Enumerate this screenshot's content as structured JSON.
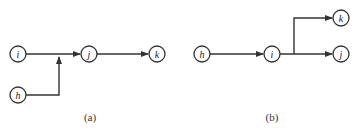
{
  "diagrams": [
    {
      "id": "a",
      "caption": "(a)",
      "nodes": [
        {
          "label": "i",
          "x": 18,
          "y": 54
        },
        {
          "label": "j",
          "x": 89,
          "y": 54
        },
        {
          "label": "k",
          "x": 157,
          "y": 54
        },
        {
          "label": "h",
          "x": 18,
          "y": 95
        }
      ],
      "edges": [
        {
          "from": "i",
          "to": "j"
        },
        {
          "from": "j",
          "to": "k"
        },
        {
          "from": "h",
          "to": "i-j edge (merge)"
        }
      ]
    },
    {
      "id": "b",
      "caption": "(b)",
      "nodes": [
        {
          "label": "h",
          "x": 202,
          "y": 54
        },
        {
          "label": "i",
          "x": 272,
          "y": 54
        },
        {
          "label": "j",
          "x": 341,
          "y": 54
        },
        {
          "label": "k",
          "x": 341,
          "y": 18
        }
      ],
      "edges": [
        {
          "from": "h",
          "to": "i"
        },
        {
          "from": "i",
          "to": "j"
        },
        {
          "from": "i",
          "to": "k"
        }
      ]
    }
  ],
  "colors": {
    "line": "#333333",
    "background": "#ffffff"
  }
}
